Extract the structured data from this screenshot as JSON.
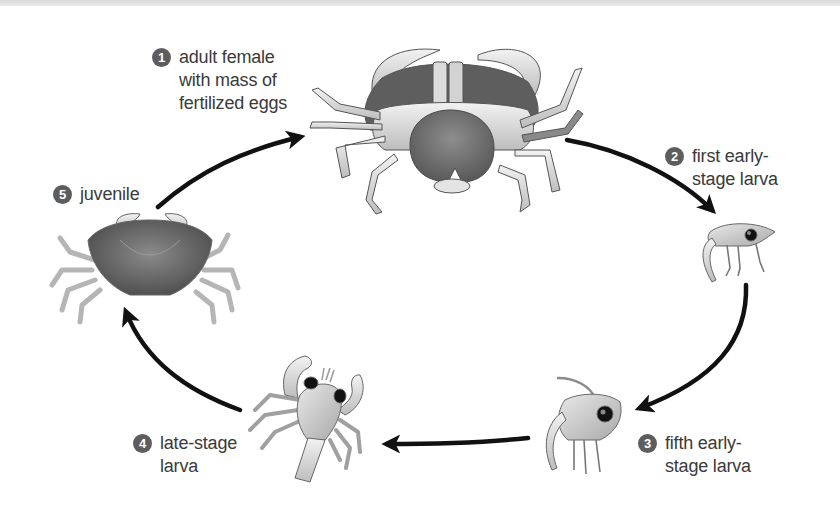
{
  "diagram": {
    "type": "life-cycle",
    "colors": {
      "badge": "#5d5d5d",
      "badge_text": "#ffffff",
      "label_text": "#3a3a3a",
      "arrow": "#111111",
      "background": "#ffffff"
    },
    "stages": [
      {
        "number": "1",
        "lines": [
          "adult female",
          "with mass of",
          "fertilized eggs"
        ]
      },
      {
        "number": "2",
        "lines": [
          "first early-",
          "stage larva"
        ]
      },
      {
        "number": "3",
        "lines": [
          "fifth early-",
          "stage larva"
        ]
      },
      {
        "number": "4",
        "lines": [
          "late-stage",
          "larva"
        ]
      },
      {
        "number": "5",
        "lines": [
          "juvenile"
        ]
      }
    ],
    "arrows": [
      {
        "from": "5",
        "to": "1"
      },
      {
        "from": "1",
        "to": "2"
      },
      {
        "from": "2",
        "to": "3"
      },
      {
        "from": "3",
        "to": "4"
      },
      {
        "from": "4",
        "to": "5"
      }
    ],
    "icons": {
      "stage_1": "adult-female-crab-underside-icon",
      "stage_2": "zoea-larva-icon",
      "stage_3": "late-zoea-larva-icon",
      "stage_4": "megalopa-larva-icon",
      "stage_5": "juvenile-crab-icon"
    }
  }
}
